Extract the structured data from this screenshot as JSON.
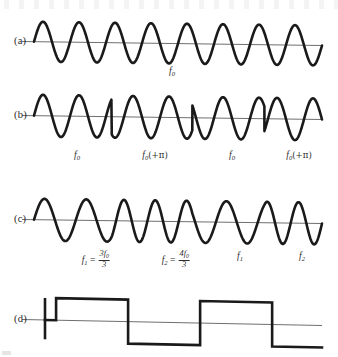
{
  "figure": {
    "axis_color": "#6f6f6f",
    "wave_color": "#1a1a1a",
    "background": "#ffffff"
  },
  "rows": [
    {
      "id": "a",
      "tag": "(a)",
      "type": "continuous-sine",
      "description": "Unmodulated carrier of constant frequency and phase",
      "labels": [
        {
          "text": "f0",
          "base": "f",
          "sub": "0",
          "x_pct": 50
        }
      ]
    },
    {
      "id": "b",
      "tag": "(b)",
      "type": "phase-shift-keying",
      "description": "Phase-shift keyed carrier; phase reverses by pi at each symbol boundary",
      "labels": [
        {
          "text": "f0",
          "base": "f",
          "sub": "0",
          "x_pct": 20
        },
        {
          "text": "f0(+pi)",
          "base": "f",
          "sub": "0",
          "suffix": "(+π)",
          "x_pct": 45
        },
        {
          "text": "f0",
          "base": "f",
          "sub": "0",
          "x_pct": 70
        },
        {
          "text": "f0(+pi)",
          "base": "f",
          "sub": "0",
          "suffix": "(+π)",
          "x_pct": 92
        }
      ]
    },
    {
      "id": "c",
      "tag": "(c)",
      "type": "frequency-shift-keying",
      "description": "Frequency-shift keyed carrier alternating between two tone frequencies",
      "labels": [
        {
          "text": "f1 = 3f0/3",
          "base": "f",
          "sub": "1",
          "equals": "=",
          "num": "3f",
          "num_sub": "0",
          "den": "3",
          "x_pct": 22
        },
        {
          "text": "f2 = 4f0/3",
          "base": "f",
          "sub": "2",
          "equals": "=",
          "num": "4f",
          "num_sub": "0",
          "den": "3",
          "x_pct": 50
        },
        {
          "text": "f1",
          "base": "f",
          "sub": "1",
          "x_pct": 70
        },
        {
          "text": "f2",
          "base": "f",
          "sub": "2",
          "x_pct": 91
        }
      ]
    },
    {
      "id": "d",
      "tag": "(d)",
      "type": "binary-square-wave",
      "description": "Binary modulating data stream",
      "labels": []
    }
  ],
  "chart_data": {
    "type": "line",
    "xlabel": "",
    "ylabel": "",
    "grid": false,
    "legend_position": "none",
    "panels": [
      {
        "id": "a",
        "tag": "(a)",
        "kind": "sine",
        "cycles": 8,
        "amplitude": 1.0,
        "phase_segments": [
          {
            "start_pct": 0,
            "end_pct": 100,
            "relative_frequency": 1.0,
            "phase_deg": 0,
            "label": "f0"
          }
        ],
        "annotations": [
          "f0"
        ]
      },
      {
        "id": "b",
        "tag": "(b)",
        "kind": "sine-psk",
        "cycles": 8,
        "amplitude": 1.0,
        "phase_segments": [
          {
            "start_pct": 0,
            "end_pct": 27,
            "relative_frequency": 1.0,
            "phase_deg": 0,
            "label": "f0"
          },
          {
            "start_pct": 27,
            "end_pct": 55,
            "relative_frequency": 1.0,
            "phase_deg": 180,
            "label": "f0(+π)"
          },
          {
            "start_pct": 55,
            "end_pct": 80,
            "relative_frequency": 1.0,
            "phase_deg": 0,
            "label": "f0"
          },
          {
            "start_pct": 80,
            "end_pct": 100,
            "relative_frequency": 1.0,
            "phase_deg": 180,
            "label": "f0(+π)"
          }
        ],
        "annotations": [
          "f0",
          "f0(+π)",
          "f0",
          "f0(+π)"
        ]
      },
      {
        "id": "c",
        "tag": "(c)",
        "kind": "sine-fsk",
        "cycles": 8,
        "amplitude": 1.0,
        "phase_segments": [
          {
            "start_pct": 0,
            "end_pct": 27,
            "relative_frequency": 1.0,
            "phase_deg": 0,
            "label": "f1 = 3f0/3"
          },
          {
            "start_pct": 27,
            "end_pct": 55,
            "relative_frequency": 1.3333,
            "phase_deg": 0,
            "label": "f2 = 4f0/3"
          },
          {
            "start_pct": 55,
            "end_pct": 80,
            "relative_frequency": 1.0,
            "phase_deg": 0,
            "label": "f1"
          },
          {
            "start_pct": 80,
            "end_pct": 100,
            "relative_frequency": 1.3333,
            "phase_deg": 0,
            "label": "f2"
          }
        ],
        "annotations": [
          "f1 = 3f0/3",
          "f2 = 4f0/3",
          "f1",
          "f2"
        ]
      },
      {
        "id": "d",
        "tag": "(d)",
        "kind": "square",
        "amplitude": 1.0,
        "levels": [
          {
            "start_pct": 0,
            "end_pct": 4,
            "value": 0
          },
          {
            "start_pct": 4,
            "end_pct": 30,
            "value": 1
          },
          {
            "start_pct": 30,
            "end_pct": 56,
            "value": -1
          },
          {
            "start_pct": 56,
            "end_pct": 82,
            "value": 1
          },
          {
            "start_pct": 82,
            "end_pct": 100,
            "value": -1
          }
        ],
        "bits": [
          1,
          0,
          1,
          0
        ],
        "annotations": []
      }
    ]
  }
}
